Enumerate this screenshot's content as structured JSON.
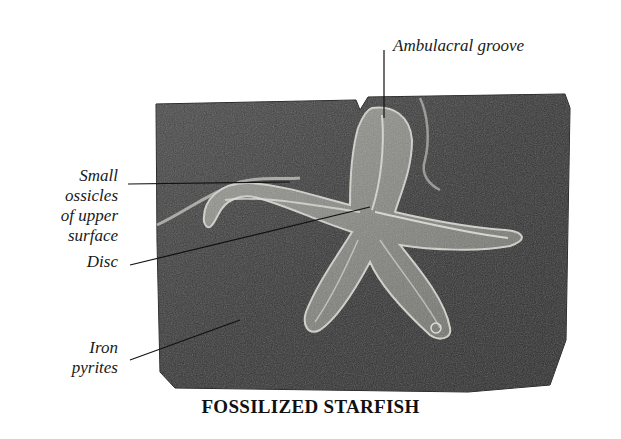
{
  "caption": "FOSSILIZED STARFISH",
  "labels": {
    "ambulacral_groove": "Ambulacral groove",
    "small_ossicles_1": "Small",
    "small_ossicles_2": "ossicles",
    "small_ossicles_3": "of upper",
    "small_ossicles_4": "surface",
    "disc": "Disc",
    "iron_pyrites_1": "Iron",
    "iron_pyrites_2": "pyrites"
  },
  "colors": {
    "slab": "#3a3a3a",
    "slab_light": "#5a5a5a",
    "starfish": "#8a8a86",
    "starfish_edge": "#c9c9c4",
    "leader": "#111111"
  }
}
